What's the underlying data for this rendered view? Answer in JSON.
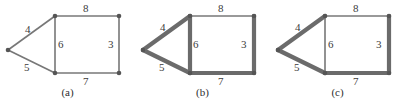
{
  "figure": {
    "background_color": "#ffffff",
    "edge_color": "#6b6b6b",
    "edge_color_thin": "#777777",
    "vertex_color": "#555555",
    "label_color": "#3b3b3b",
    "caption_color": "#2e2e2e",
    "thin_width": 1.6,
    "thick_width": 4.2,
    "panels": [
      {
        "id": "a",
        "caption": "(a)",
        "vertices": [
          {
            "name": "left-apex",
            "x": 8,
            "y": 50
          },
          {
            "name": "top-left",
            "x": 55,
            "y": 16
          },
          {
            "name": "top-right",
            "x": 119,
            "y": 16
          },
          {
            "name": "bottom-left",
            "x": 55,
            "y": 73
          },
          {
            "name": "bottom-right",
            "x": 119,
            "y": 73
          }
        ],
        "edges": [
          {
            "name": "edge-4",
            "from": "left-apex",
            "to": "top-left",
            "weight": "4",
            "thick": false,
            "label_x": 25,
            "label_y": 24
          },
          {
            "name": "edge-5",
            "from": "left-apex",
            "to": "bottom-left",
            "weight": "5",
            "thick": false,
            "label_x": 24,
            "label_y": 62
          },
          {
            "name": "edge-6",
            "from": "top-left",
            "to": "bottom-left",
            "weight": "6",
            "thick": false,
            "label_x": 58,
            "label_y": 39
          },
          {
            "name": "edge-8",
            "from": "top-left",
            "to": "top-right",
            "weight": "8",
            "thick": false,
            "label_x": 83,
            "label_y": 3
          },
          {
            "name": "edge-3",
            "from": "top-right",
            "to": "bottom-right",
            "weight": "3",
            "thick": false,
            "label_x": 108,
            "label_y": 39
          },
          {
            "name": "edge-7",
            "from": "bottom-left",
            "to": "bottom-right",
            "weight": "7",
            "thick": false,
            "label_x": 83,
            "label_y": 76
          }
        ]
      },
      {
        "id": "b",
        "caption": "(b)",
        "vertices": [
          {
            "name": "left-apex",
            "x": 8,
            "y": 50
          },
          {
            "name": "top-left",
            "x": 55,
            "y": 16
          },
          {
            "name": "top-right",
            "x": 119,
            "y": 16
          },
          {
            "name": "bottom-left",
            "x": 55,
            "y": 73
          },
          {
            "name": "bottom-right",
            "x": 119,
            "y": 73
          }
        ],
        "edges": [
          {
            "name": "edge-4",
            "from": "left-apex",
            "to": "top-left",
            "weight": "4",
            "thick": true,
            "label_x": 25,
            "label_y": 22
          },
          {
            "name": "edge-5",
            "from": "left-apex",
            "to": "bottom-left",
            "weight": "5",
            "thick": true,
            "label_x": 24,
            "label_y": 62
          },
          {
            "name": "edge-6",
            "from": "top-left",
            "to": "bottom-left",
            "weight": "6",
            "thick": true,
            "label_x": 58,
            "label_y": 39
          },
          {
            "name": "edge-8",
            "from": "top-left",
            "to": "top-right",
            "weight": "8",
            "thick": false,
            "label_x": 83,
            "label_y": 3
          },
          {
            "name": "edge-3",
            "from": "top-right",
            "to": "bottom-right",
            "weight": "3",
            "thick": true,
            "label_x": 106,
            "label_y": 39
          },
          {
            "name": "edge-7",
            "from": "bottom-left",
            "to": "bottom-right",
            "weight": "7",
            "thick": true,
            "label_x": 83,
            "label_y": 76
          }
        ]
      },
      {
        "id": "c",
        "caption": "(c)",
        "vertices": [
          {
            "name": "left-apex",
            "x": 8,
            "y": 50
          },
          {
            "name": "top-left",
            "x": 55,
            "y": 16
          },
          {
            "name": "top-right",
            "x": 119,
            "y": 16
          },
          {
            "name": "bottom-left",
            "x": 55,
            "y": 73
          },
          {
            "name": "bottom-right",
            "x": 119,
            "y": 73
          }
        ],
        "edges": [
          {
            "name": "edge-4",
            "from": "left-apex",
            "to": "top-left",
            "weight": "4",
            "thick": true,
            "label_x": 25,
            "label_y": 22
          },
          {
            "name": "edge-5",
            "from": "left-apex",
            "to": "bottom-left",
            "weight": "5",
            "thick": true,
            "label_x": 24,
            "label_y": 62
          },
          {
            "name": "edge-6",
            "from": "top-left",
            "to": "bottom-left",
            "weight": "6",
            "thick": false,
            "label_x": 58,
            "label_y": 39
          },
          {
            "name": "edge-8",
            "from": "top-left",
            "to": "top-right",
            "weight": "8",
            "thick": false,
            "label_x": 83,
            "label_y": 3
          },
          {
            "name": "edge-3",
            "from": "top-right",
            "to": "bottom-right",
            "weight": "3",
            "thick": true,
            "label_x": 106,
            "label_y": 39
          },
          {
            "name": "edge-7",
            "from": "bottom-left",
            "to": "bottom-right",
            "weight": "7",
            "thick": true,
            "label_x": 83,
            "label_y": 76
          }
        ]
      }
    ]
  }
}
